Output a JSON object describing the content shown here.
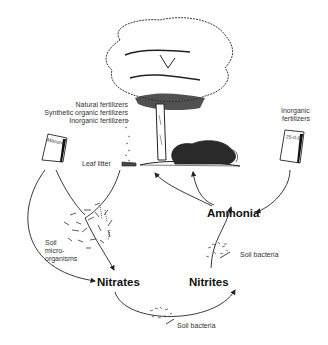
{
  "diagram": {
    "type": "nitrogen-cycle",
    "labels": {
      "fertilizer_sources": [
        "Natural fertilizers",
        "Synthetic organic fertilizers",
        "Inorganic fertilizers"
      ],
      "manure_bag": "Manure",
      "inorganic_fertilizers": [
        "Inorganic",
        "fertilizers"
      ],
      "inorganic_bag": "25-0-0",
      "leaf_litter": "Leaf litter",
      "soil_microorganisms": [
        "Soil",
        "micro-",
        "organisms"
      ],
      "ammonia": "Ammonia",
      "nitrates": "Nitrates",
      "nitrites": "Nitrites",
      "soil_bacteria_1": "Soil bacteria",
      "soil_bacteria_2": "Soil bacteria"
    },
    "flows": [
      {
        "from": "Manure",
        "to": "Nitrates"
      },
      {
        "from": "Manure",
        "to": "Soil micro-organisms"
      },
      {
        "from": "Leaf litter",
        "to": "Soil micro-organisms"
      },
      {
        "from": "Soil micro-organisms",
        "to": "Nitrates"
      },
      {
        "from": "Nitrates",
        "to": "Nitrites",
        "via": "Soil bacteria"
      },
      {
        "from": "Nitrites",
        "to": "Ammonia",
        "via": "Soil bacteria"
      },
      {
        "from": "Inorganic fertilizers",
        "to": "Ammonia"
      },
      {
        "from": "Ammonia",
        "to": "Tree"
      },
      {
        "from": "Ammonia",
        "to": "Shrub"
      }
    ]
  }
}
